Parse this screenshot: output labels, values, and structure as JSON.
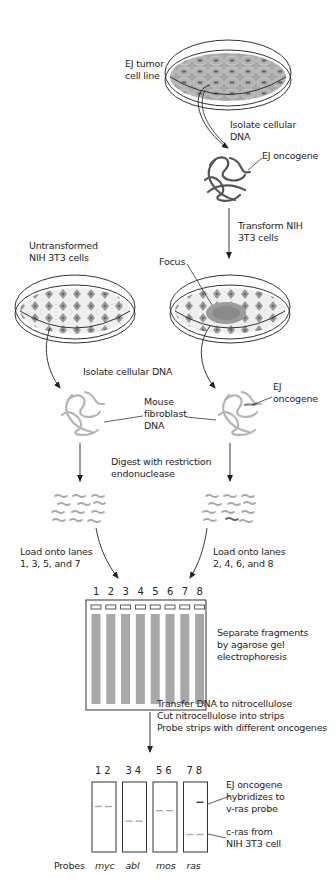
{
  "labels": {
    "ej_tumor": [
      "EJ tumor",
      "cell line"
    ],
    "isolate_dna_top": [
      "Isolate cellular",
      "DNA"
    ],
    "ej_oncogene_top": "EJ oncogene",
    "transform": [
      "Transform NIH",
      "3T3 cells"
    ],
    "untransformed": [
      "Untransformed",
      "NIH 3T3 cells"
    ],
    "focus": "Focus",
    "isolate_dna_mid": "Isolate cellular DNA",
    "ej_oncogene_mid": [
      "EJ",
      "oncogene"
    ],
    "mouse_dna": [
      "Mouse",
      "fibroblast",
      "DNA"
    ],
    "digest": [
      "Digest with restriction",
      "endonuclease"
    ],
    "load_left": [
      "Load onto lanes",
      "1, 3, 5, and 7"
    ],
    "load_right": [
      "Load onto lanes",
      "2, 4, 6, and 8"
    ],
    "separate": [
      "Separate fragments",
      "by agarose gel",
      "electrophoresis"
    ],
    "transfer": [
      "Transfer DNA to nitrocellulose",
      "Cut nitrocellulose into strips",
      "Probe strips with different oncogenes"
    ],
    "ej_hybridizes": [
      "EJ oncogene",
      "hybridizes to",
      "v-ras probe"
    ],
    "c_ras": [
      "c-ras from",
      "NIH 3T3 cell"
    ],
    "probes_label": "Probes"
  },
  "gel": {
    "lanes": [
      "1",
      "2",
      "3",
      "4",
      "5",
      "6",
      "7",
      "8"
    ],
    "lane_fill": "#a8a8a8",
    "border": "#333333"
  },
  "strips": [
    {
      "lanes": "1 2",
      "probe": "myc",
      "bands": [
        {
          "lane": 1,
          "y": 0.35
        },
        {
          "lane": 2,
          "y": 0.35
        }
      ]
    },
    {
      "lanes": "3 4",
      "probe": "abl",
      "bands": [
        {
          "lane": 3,
          "y": 0.56
        },
        {
          "lane": 4,
          "y": 0.56
        }
      ]
    },
    {
      "lanes": "5 6",
      "probe": "mos",
      "bands": [
        {
          "lane": 5,
          "y": 0.41
        },
        {
          "lane": 6,
          "y": 0.41
        }
      ]
    },
    {
      "lanes": "7 8",
      "probe": "ras",
      "bands": [
        {
          "lane": 8,
          "y": 0.29,
          "dark": true
        },
        {
          "lane": 7,
          "y": 0.75
        },
        {
          "lane": 8,
          "y": 0.75
        }
      ]
    }
  ],
  "colors": {
    "cell_fill": "#9a9a9a",
    "cell_dark": "#6e6e6e",
    "dna_dark": "#555555",
    "dna_light": "#b5b5b5",
    "line": "#333333"
  }
}
